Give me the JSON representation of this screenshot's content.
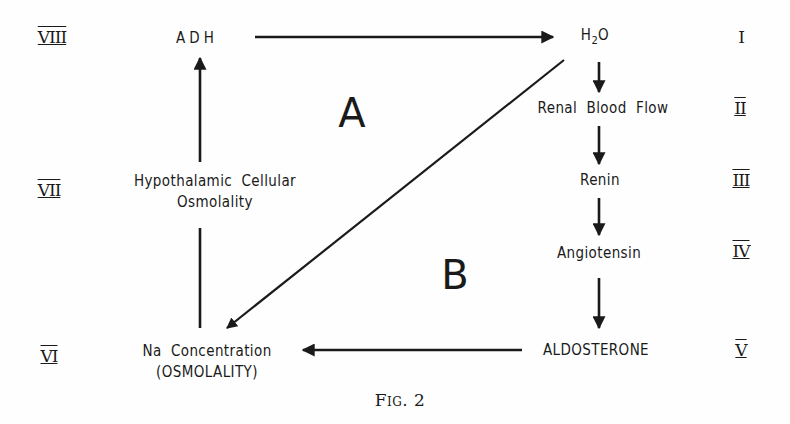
{
  "nodes": {
    "adh": "ADH",
    "h2o_h": "H",
    "h2o_sub": "2",
    "h2o_o": "O",
    "renal_blood_flow": "Renal  Blood  Flow",
    "renin": "Renin",
    "angiotensin": "Angiotensin",
    "aldosterone": "ALDOSTERONE",
    "na_concentration_line1": "Na  Concentration",
    "na_concentration_line2": "(OSMOLALITY)",
    "hypothalamic_line1": "Hypothalamic  Cellular",
    "hypothalamic_line2": "Osmolality"
  },
  "roman_numerals": {
    "r1": "I",
    "r2": "II",
    "r3": "III",
    "r4": "IV",
    "r5": "V",
    "r6": "VI",
    "r7": "VII",
    "r8": "VIII"
  },
  "regions": {
    "a": "A",
    "b": "B"
  },
  "caption": "Fig. 2",
  "edges": [
    {
      "from": "ADH",
      "to": "H2O"
    },
    {
      "from": "H2O",
      "to": "Renal Blood Flow"
    },
    {
      "from": "Renal Blood Flow",
      "to": "Renin"
    },
    {
      "from": "Renin",
      "to": "Angiotensin"
    },
    {
      "from": "Angiotensin",
      "to": "ALDOSTERONE"
    },
    {
      "from": "ALDOSTERONE",
      "to": "Na Concentration (OSMOLALITY)"
    },
    {
      "from": "H2O",
      "to": "Na Concentration (OSMOLALITY)"
    },
    {
      "from": "Na Concentration (OSMOLALITY)",
      "to": "Hypothalamic Cellular Osmolality"
    },
    {
      "from": "Hypothalamic Cellular Osmolality",
      "to": "ADH"
    }
  ],
  "colors": {
    "ink": "#1a1a1a",
    "background": "#fefefe"
  }
}
